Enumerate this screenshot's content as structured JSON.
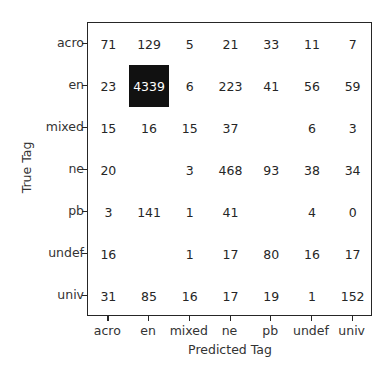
{
  "chart_data": {
    "type": "heatmap",
    "title": "Confusion Matrix",
    "xlabel": "Predicted Tag",
    "ylabel": "True Tag",
    "x_categories": [
      "acro",
      "en",
      "mixed",
      "ne",
      "pb",
      "undef",
      "univ"
    ],
    "y_categories": [
      "acro",
      "en",
      "mixed",
      "ne",
      "pb",
      "undef",
      "univ"
    ],
    "matrix": [
      [
        71,
        129,
        5,
        21,
        33,
        11,
        7
      ],
      [
        23,
        4339,
        6,
        223,
        41,
        56,
        59
      ],
      [
        15,
        16,
        15,
        37,
        null,
        6,
        3
      ],
      [
        20,
        null,
        3,
        468,
        93,
        38,
        34
      ],
      [
        3,
        141,
        1,
        41,
        null,
        4,
        0
      ],
      [
        16,
        null,
        1,
        17,
        80,
        16,
        17
      ],
      [
        31,
        85,
        16,
        17,
        19,
        1,
        152
      ]
    ],
    "note": "null = cell value not visible (rendered in white on light background)",
    "colormap": "greys",
    "grid": false,
    "colorbar": false
  },
  "colors": {
    "max_cell": "#111111",
    "background": "#ffffff",
    "text": "#262626",
    "text_on_dark": "#ffffff"
  }
}
